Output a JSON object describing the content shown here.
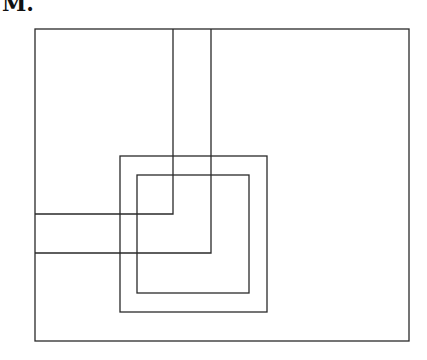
{
  "label": "M.",
  "colors": {
    "stroke": "#2a2a2a",
    "background": "#ffffff"
  },
  "diagram": {
    "outer_rect": {
      "x1": 35,
      "y1": 29,
      "x2": 409,
      "y2": 341
    },
    "outer_square": {
      "x1": 120,
      "y1": 156,
      "x2": 267,
      "y2": 312
    },
    "inner_square": {
      "x1": 137,
      "y1": 175,
      "x2": 249,
      "y2": 293
    },
    "l_band": {
      "inner_l": {
        "vertical_x": 173,
        "horizontal_y": 214
      },
      "outer_l": {
        "vertical_x": 211,
        "horizontal_y": 253
      }
    }
  }
}
